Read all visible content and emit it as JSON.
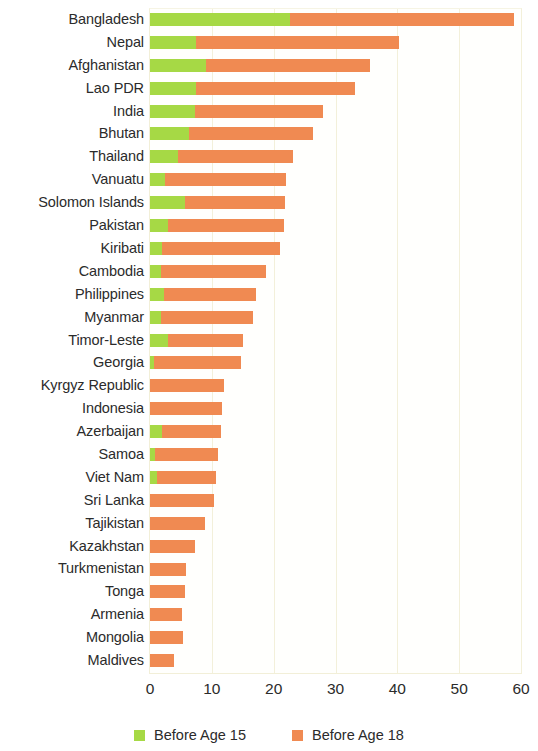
{
  "chart_data": {
    "type": "bar",
    "orientation": "horizontal",
    "stacked": false,
    "overlay": true,
    "title": "",
    "subtitle": "",
    "xlabel": "",
    "ylabel": "",
    "xlim": [
      0,
      60
    ],
    "xticks": [
      0,
      10,
      20,
      30,
      40,
      50,
      60
    ],
    "xtick_labels": [
      "0",
      "10",
      "20",
      "30",
      "40",
      "50",
      "60"
    ],
    "grid": true,
    "grid_axis": "x",
    "legend_position": "bottom",
    "categories": [
      "Bangladesh",
      "Nepal",
      "Afghanistan",
      "Lao PDR",
      "India",
      "Bhutan",
      "Thailand",
      "Vanuatu",
      "Solomon Islands",
      "Pakistan",
      "Kiribati",
      "Cambodia",
      "Philippines",
      "Myanmar",
      "Timor-Leste",
      "Georgia",
      "Kyrgyz Republic",
      "Indonesia",
      "Azerbaijan",
      "Samoa",
      "Viet Nam",
      "Sri Lanka",
      "Tajikistan",
      "Kazakhstan",
      "Turkmenistan",
      "Tonga",
      "Armenia",
      "Mongolia",
      "Maldives"
    ],
    "series": [
      {
        "name": "Before Age 15",
        "color": "#a6d945",
        "values": [
          22.6,
          7.4,
          9.1,
          7.4,
          7.2,
          6.3,
          4.6,
          2.5,
          5.6,
          2.9,
          2.0,
          1.8,
          2.2,
          1.8,
          2.9,
          0.7,
          0.0,
          0.0,
          2.0,
          0.8,
          1.2,
          0.0,
          0.0,
          0.0,
          0.0,
          0.0,
          0.0,
          0.0,
          0.0
        ]
      },
      {
        "name": "Before Age 18",
        "color": "#f08a52",
        "values": [
          58.9,
          40.3,
          35.5,
          33.2,
          28.0,
          26.3,
          23.1,
          22.0,
          21.8,
          21.7,
          21.0,
          18.8,
          17.1,
          16.7,
          15.1,
          14.7,
          11.9,
          11.6,
          11.5,
          11.0,
          10.7,
          10.3,
          8.9,
          7.2,
          5.9,
          5.6,
          5.2,
          5.3,
          3.9
        ]
      }
    ]
  },
  "legend": {
    "items": [
      {
        "label": "Before Age 15",
        "color": "#a6d945",
        "swatch": "green"
      },
      {
        "label": "Before Age 18",
        "color": "#f08a52",
        "swatch": "orange"
      }
    ]
  },
  "colors": {
    "before_age_15": "#a6d945",
    "before_age_18": "#f08a52",
    "gridline": "#f3f0da",
    "text": "#2b2b2b",
    "background": "#ffffff"
  }
}
